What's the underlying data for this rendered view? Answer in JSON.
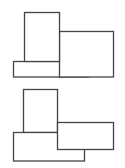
{
  "canvas": {
    "width": 125,
    "height": 168,
    "background": "#ffffff",
    "stroke": "#444444"
  },
  "figures": [
    {
      "name": "figure-top",
      "blocks": [
        {
          "name": "bottom-bar",
          "x": 13.5,
          "y": 61.5,
          "w": 75,
          "h": 15.5
        },
        {
          "name": "right-block",
          "x": 59.5,
          "y": 31.5,
          "w": 54,
          "h": 45.5
        },
        {
          "name": "tall-block",
          "x": 24.5,
          "y": 12.5,
          "w": 35,
          "h": 49
        }
      ]
    },
    {
      "name": "figure-bottom",
      "blocks": [
        {
          "name": "tall-block",
          "x": 23.5,
          "y": 89.5,
          "w": 34,
          "h": 43
        },
        {
          "name": "bottom-bar",
          "x": 13.5,
          "y": 132.5,
          "w": 71,
          "h": 28.5
        },
        {
          "name": "right-block",
          "x": 57.5,
          "y": 122.5,
          "w": 56,
          "h": 27
        }
      ]
    }
  ]
}
